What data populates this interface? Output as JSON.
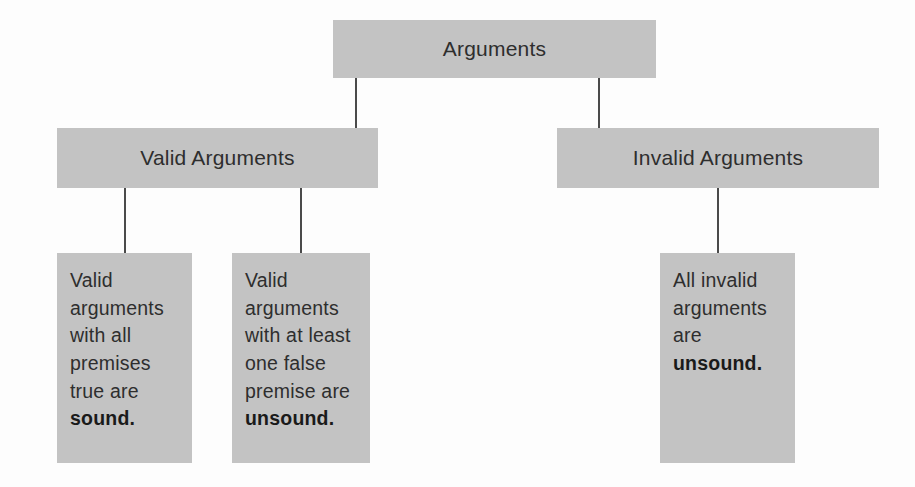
{
  "diagram": {
    "title_text": "Arguments",
    "nodes": {
      "root": {
        "label": "Arguments"
      },
      "valid": {
        "label": "Valid Arguments"
      },
      "invalid": {
        "label": "Invalid Arguments"
      },
      "valid_sound": {
        "text_normal": "Valid arguments with all premises true are ",
        "text_bold": "sound.",
        "full_text": "Valid arguments with all premises true are sound."
      },
      "valid_unsound": {
        "text_normal": "Valid arguments with at least one false premise are ",
        "text_bold": "unsound.",
        "full_text": "Valid arguments with at least one false premise are unsound."
      },
      "invalid_unsound": {
        "text_normal": "All invalid arguments are ",
        "text_bold": "unsound.",
        "text_tail": ".",
        "full_text": "All invalid arguments are unsound."
      }
    },
    "colors": {
      "box_fill": "#c3c3c3",
      "text": "#2e2e2e",
      "bold_text": "#1a1a1a",
      "connector": "#4a4a4a",
      "background": "#fdfdfd"
    }
  }
}
